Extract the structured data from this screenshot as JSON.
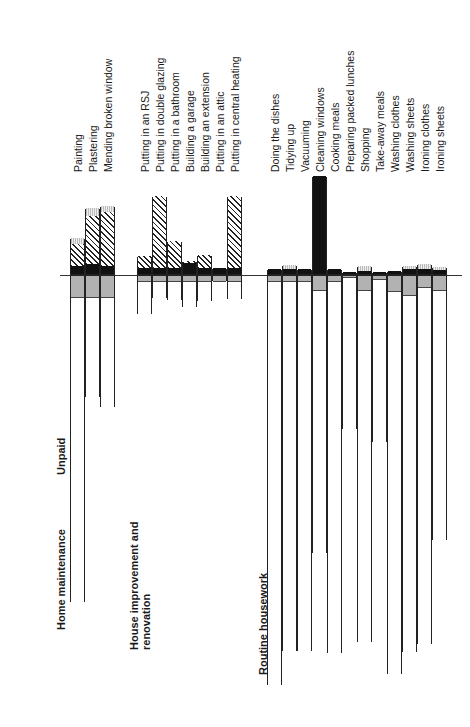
{
  "chart_data": {
    "type": "bar",
    "orientation": "rotated-90-ccw",
    "title": "",
    "axis_labels": {
      "upward": "",
      "downward": "Unpaid"
    },
    "legend": [],
    "segment_types": {
      "paid": [
        "black",
        "hatched",
        "dotted-gray-cap"
      ],
      "unpaid": [
        "gray",
        "white"
      ]
    },
    "units": "approx pixel lengths (no visible scale ticks)",
    "groups": [
      {
        "name": "Home maintenance",
        "categories": [
          {
            "label": "Painting",
            "paid": {
              "black": 8,
              "hatched": 22,
              "dotted": 6
            },
            "unpaid": {
              "gray": 22,
              "white": 305
            }
          },
          {
            "label": "Plastering",
            "paid": {
              "black": 10,
              "hatched": 48,
              "dotted": 8
            },
            "unpaid": {
              "gray": 22,
              "white": 100
            }
          },
          {
            "label": "Mending broken window",
            "paid": {
              "black": 8,
              "hatched": 54,
              "dotted": 6
            },
            "unpaid": {
              "gray": 22,
              "white": 110
            }
          }
        ]
      },
      {
        "name": "House improvement and renovation",
        "categories": [
          {
            "label": "Putting in an RSJ",
            "paid": {
              "black": 6,
              "hatched": 12
            },
            "unpaid": {
              "gray": 6,
              "white": 33
            }
          },
          {
            "label": "Putting in double glazing",
            "paid": {
              "black": 6,
              "hatched": 72
            },
            "unpaid": {
              "gray": 6,
              "white": 17
            }
          },
          {
            "label": "Putting in a bathroom",
            "paid": {
              "black": 6,
              "hatched": 27
            },
            "unpaid": {
              "gray": 6,
              "white": 19
            }
          },
          {
            "label": "Building a garage",
            "paid": {
              "black": 11,
              "hatched": 2
            },
            "unpaid": {
              "gray": 6,
              "white": 26
            }
          },
          {
            "label": "Building an extension",
            "paid": {
              "black": 6,
              "hatched": 13
            },
            "unpaid": {
              "gray": 6,
              "white": 20
            }
          },
          {
            "label": "Putting in an attic",
            "paid": {
              "black": 6,
              "hatched": 0
            },
            "unpaid": {
              "gray": 6,
              "white": 0
            }
          },
          {
            "label": "Putting in central heating",
            "paid": {
              "black": 6,
              "hatched": 72
            },
            "unpaid": {
              "gray": 6,
              "white": 18
            }
          }
        ]
      },
      {
        "name": "Routine housework",
        "categories": [
          {
            "label": "Doing the dishes",
            "paid": {
              "black": 5,
              "dotted": 0
            },
            "unpaid": {
              "gray": 6,
              "white": 404
            }
          },
          {
            "label": "Tidying up",
            "paid": {
              "black": 5,
              "dotted": 4
            },
            "unpaid": {
              "gray": 6,
              "white": 370
            }
          },
          {
            "label": "Vacuuming",
            "paid": {
              "black": 5,
              "dotted": 0
            },
            "unpaid": {
              "gray": 6,
              "white": 370
            }
          },
          {
            "label": "Cleaning windows",
            "paid": {
              "black": 98,
              "dotted": 0
            },
            "unpaid": {
              "gray": 15,
              "white": 263
            }
          },
          {
            "label": "Cooking meals",
            "paid": {
              "black": 5,
              "dotted": 0
            },
            "unpaid": {
              "gray": 6,
              "white": 372
            }
          },
          {
            "label": "Preparing packed lunches",
            "paid": {
              "black": 2,
              "dotted": 0
            },
            "unpaid": {
              "gray": 2,
              "white": 152
            }
          },
          {
            "label": "Shopping",
            "paid": {
              "black": 3,
              "dotted": 5
            },
            "unpaid": {
              "gray": 15,
              "white": 352
            }
          },
          {
            "label": "Take-away meals",
            "paid": {
              "black": 2,
              "dotted": 0
            },
            "unpaid": {
              "gray": 4,
              "white": 163
            }
          },
          {
            "label": "Washing clothes",
            "paid": {
              "black": 3,
              "dotted": 0
            },
            "unpaid": {
              "gray": 16,
              "white": 383
            }
          },
          {
            "label": "Washing sheets",
            "paid": {
              "black": 5,
              "dotted": 3
            },
            "unpaid": {
              "gray": 20,
              "white": 357
            }
          },
          {
            "label": "Ironing clothes",
            "paid": {
              "black": 5,
              "dotted": 5
            },
            "unpaid": {
              "gray": 12,
              "white": 357
            }
          },
          {
            "label": "Ironing sheets",
            "paid": {
              "black": 4,
              "dotted": 3
            },
            "unpaid": {
              "gray": 15,
              "white": 250
            }
          }
        ]
      }
    ]
  }
}
